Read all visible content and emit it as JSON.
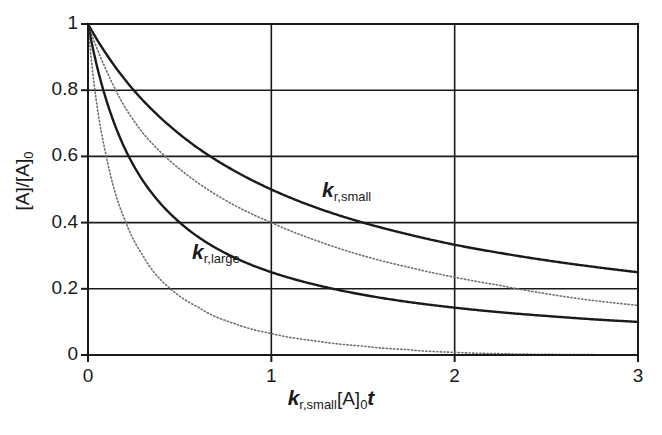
{
  "chart_data": {
    "type": "line",
    "title": "",
    "xlabel": "k_r,small[A]_0 t",
    "ylabel": "[A]/[A]_0",
    "xlim": [
      0,
      3
    ],
    "ylim": [
      0,
      1
    ],
    "xticks": [
      "0",
      "1",
      "2",
      "3"
    ],
    "yticks": [
      "0",
      "0.2",
      "0.4",
      "0.6",
      "0.8",
      "1"
    ],
    "grid": true,
    "legend_position": "inline-annotations",
    "series": [
      {
        "name": "k_r,small",
        "style": "solid",
        "color": "#1a1a1a",
        "x": [
          0,
          0.1,
          0.2,
          0.3,
          0.45,
          0.6,
          0.8,
          1.0,
          1.25,
          1.5,
          1.75,
          2.0,
          2.25,
          2.5,
          2.75,
          3.0
        ],
        "y": [
          1.0,
          0.909,
          0.833,
          0.769,
          0.69,
          0.625,
          0.556,
          0.5,
          0.444,
          0.4,
          0.364,
          0.333,
          0.308,
          0.286,
          0.267,
          0.25
        ]
      },
      {
        "name": "dotted-upper",
        "style": "dotted",
        "color": "#6e6e6e",
        "x": [
          0,
          0.1,
          0.2,
          0.3,
          0.45,
          0.6,
          0.8,
          1.0,
          1.25,
          1.5,
          1.75,
          2.0,
          2.25,
          2.5,
          2.75,
          3.0
        ],
        "y": [
          1.0,
          0.86,
          0.75,
          0.67,
          0.585,
          0.52,
          0.452,
          0.4,
          0.345,
          0.3,
          0.265,
          0.235,
          0.21,
          0.185,
          0.165,
          0.15
        ]
      },
      {
        "name": "k_r,large",
        "style": "solid",
        "color": "#1a1a1a",
        "x": [
          0,
          0.1,
          0.2,
          0.3,
          0.45,
          0.6,
          0.8,
          1.0,
          1.25,
          1.5,
          1.75,
          2.0,
          2.25,
          2.5,
          2.75,
          3.0
        ],
        "y": [
          1.0,
          0.77,
          0.625,
          0.526,
          0.426,
          0.357,
          0.294,
          0.25,
          0.211,
          0.182,
          0.16,
          0.143,
          0.129,
          0.118,
          0.108,
          0.1
        ]
      },
      {
        "name": "dotted-lower",
        "style": "dotted",
        "color": "#6e6e6e",
        "x": [
          0,
          0.1,
          0.2,
          0.3,
          0.45,
          0.6,
          0.8,
          1.0,
          1.25,
          1.5,
          1.75,
          2.0,
          2.25,
          2.5,
          2.75,
          3.0
        ],
        "y": [
          1.0,
          0.6,
          0.41,
          0.3,
          0.2,
          0.145,
          0.095,
          0.065,
          0.042,
          0.027,
          0.016,
          0.008,
          0.004,
          0.002,
          0.001,
          0.0
        ]
      }
    ],
    "annotations": [
      {
        "text": "k_r,small",
        "x": 1.35,
        "y": 0.52
      },
      {
        "text": "k_r,large",
        "x": 0.65,
        "y": 0.33
      }
    ]
  },
  "axes": {
    "x": {
      "ticks": [
        {
          "label": "0",
          "value": 0
        },
        {
          "label": "1",
          "value": 1
        },
        {
          "label": "2",
          "value": 2
        },
        {
          "label": "3",
          "value": 3
        }
      ],
      "title_parts": {
        "k": "k",
        "sub": "r,small",
        "bracket": "[A]",
        "sub0": "0",
        "t": "t"
      }
    },
    "y": {
      "ticks": [
        {
          "label": "0",
          "value": 0
        },
        {
          "label": "0.2",
          "value": 0.2
        },
        {
          "label": "0.4",
          "value": 0.4
        },
        {
          "label": "0.6",
          "value": 0.6
        },
        {
          "label": "0.8",
          "value": 0.8
        },
        {
          "label": "1",
          "value": 1
        }
      ],
      "title_parts": {
        "num": "[A]/[A]",
        "sub0": "0"
      }
    }
  },
  "labels": {
    "curve_small": {
      "k": "k",
      "sub": "r,small"
    },
    "curve_large": {
      "k": "k",
      "sub": "r,large"
    }
  },
  "colors": {
    "axis": "#1a1a1a",
    "grid": "#1a1a1a",
    "solid_curve": "#1a1a1a",
    "dotted_curve": "#707070",
    "background": "#ffffff"
  }
}
